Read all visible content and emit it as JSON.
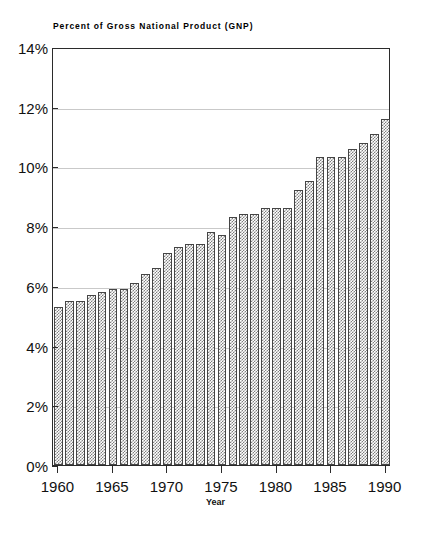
{
  "chart_data": {
    "type": "bar",
    "title": "Percent of Gross National Product (GNP)",
    "xlabel": "Year",
    "ylabel": "",
    "ylim": [
      0,
      14
    ],
    "grid": true,
    "legend": "none",
    "y_ticks": [
      "0%",
      "2%",
      "4%",
      "6%",
      "8%",
      "10%",
      "12%",
      "14%"
    ],
    "y_tick_values": [
      0,
      2,
      4,
      6,
      8,
      10,
      12,
      14
    ],
    "x_ticks": [
      "1960",
      "1965",
      "1970",
      "1975",
      "1980",
      "1985",
      "1990"
    ],
    "x_tick_values": [
      1960,
      1965,
      1970,
      1975,
      1980,
      1985,
      1990
    ],
    "categories": [
      1960,
      1961,
      1962,
      1963,
      1964,
      1965,
      1966,
      1967,
      1968,
      1969,
      1970,
      1971,
      1972,
      1973,
      1974,
      1975,
      1976,
      1977,
      1978,
      1979,
      1980,
      1981,
      1982,
      1983,
      1984,
      1985,
      1986,
      1987,
      1988,
      1989,
      1990
    ],
    "values": [
      5.3,
      5.5,
      5.5,
      5.7,
      5.8,
      5.9,
      5.9,
      6.1,
      6.4,
      6.6,
      7.1,
      7.3,
      7.4,
      7.4,
      7.8,
      7.7,
      8.3,
      8.4,
      8.4,
      8.6,
      8.6,
      8.6,
      9.2,
      9.5,
      10.3,
      10.3,
      10.3,
      10.6,
      10.8,
      11.1,
      11.6
    ],
    "final_value": 12.2
  },
  "axes": {
    "y_title": "",
    "x_title": "Year"
  }
}
